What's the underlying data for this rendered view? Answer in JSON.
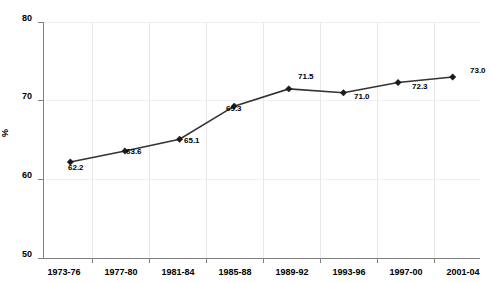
{
  "chart_data": {
    "type": "line",
    "title": "",
    "title_clipped": true,
    "xlabel": "",
    "ylabel": "%",
    "categories": [
      "1973-76",
      "1977-80",
      "1981-84",
      "1985-88",
      "1989-92",
      "1993-96",
      "1997-00",
      "2001-04"
    ],
    "values": [
      62.2,
      63.6,
      65.1,
      69.3,
      71.5,
      71.0,
      72.3,
      73.0
    ],
    "point_labels": [
      "62.2",
      "63.6",
      "65.1",
      "69.3",
      "71.5",
      "71.0",
      "72.3",
      "73.0"
    ],
    "ylim": [
      50,
      80
    ],
    "yticks": [
      80,
      70,
      60,
      50
    ],
    "ytick_labels": [
      "80",
      "70",
      "60",
      "50"
    ],
    "grid": "vertical-and-horizontal",
    "legend": "none",
    "series": [
      {
        "name": "",
        "marker": "diamond",
        "color": "#333333",
        "values": [
          62.2,
          63.6,
          65.1,
          69.3,
          71.5,
          71.0,
          72.3,
          73.0
        ]
      }
    ],
    "colors": {
      "line": "#333333",
      "marker": "#1a1a1a",
      "gridline": "#e8e8e8",
      "axis": "#808080",
      "background": "#ffffff",
      "text": "#000000"
    }
  }
}
